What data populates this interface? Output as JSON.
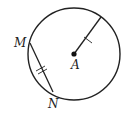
{
  "diagram": {
    "type": "geometry-circle",
    "circle": {
      "cx": 74,
      "cy": 54,
      "r": 46,
      "stroke": "#222222"
    },
    "center": {
      "label": "A",
      "x": 74,
      "y": 54
    },
    "radius_segment": {
      "from": "A",
      "to": [
        101,
        17
      ],
      "tick_marks": 1
    },
    "chord": {
      "endpoints": [
        "M",
        "N"
      ],
      "M": {
        "x": 30,
        "y": 43,
        "label": "M"
      },
      "N": {
        "x": 53,
        "y": 92,
        "label": "N"
      },
      "tick_marks": 2
    },
    "labels": {
      "A": "A",
      "M": "M",
      "N": "N"
    }
  }
}
